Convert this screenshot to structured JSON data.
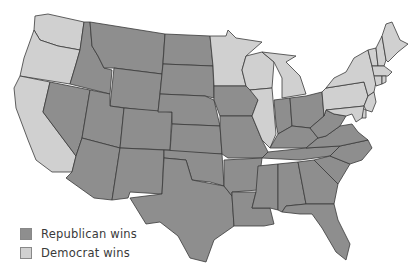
{
  "map": {
    "type": "choropleth",
    "region": "United States (contiguous 48 states)",
    "colors": {
      "republican": "#8e8e8e",
      "democrat": "#d0d0d0",
      "border": "#3a3a3a",
      "background": "#ffffff"
    },
    "states": {
      "WA": "democrat",
      "OR": "democrat",
      "CA": "democrat",
      "ID": "republican",
      "NV": "republican",
      "MT": "republican",
      "WY": "republican",
      "UT": "republican",
      "AZ": "republican",
      "CO": "republican",
      "NM": "republican",
      "ND": "republican",
      "SD": "republican",
      "NE": "republican",
      "KS": "republican",
      "OK": "republican",
      "TX": "republican",
      "MN": "democrat",
      "IA": "republican",
      "MO": "republican",
      "AR": "republican",
      "LA": "republican",
      "WI": "democrat",
      "IL": "democrat",
      "MI": "democrat",
      "IN": "republican",
      "OH": "republican",
      "KY": "republican",
      "TN": "republican",
      "MS": "republican",
      "AL": "republican",
      "GA": "republican",
      "FL": "republican",
      "SC": "republican",
      "NC": "republican",
      "VA": "republican",
      "WV": "republican",
      "PA": "democrat",
      "NY": "democrat",
      "VT": "democrat",
      "NH": "democrat",
      "ME": "democrat",
      "MA": "democrat",
      "RI": "democrat",
      "CT": "democrat",
      "NJ": "democrat",
      "DE": "democrat",
      "MD": "democrat"
    }
  },
  "legend": {
    "items": [
      {
        "label": "Republican wins",
        "color": "#8e8e8e"
      },
      {
        "label": "Democrat wins",
        "color": "#d0d0d0"
      }
    ]
  }
}
